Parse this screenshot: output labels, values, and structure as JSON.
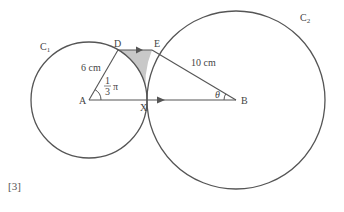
{
  "diagram": {
    "labels": {
      "c1": "C",
      "c1_sub": "1",
      "c2": "C",
      "c2_sub": "2",
      "d": "D",
      "e": "E",
      "a": "A",
      "x": "X",
      "b": "B",
      "ad_length": "6 cm",
      "eb_length": "10 cm",
      "angle_a_num": "1",
      "angle_a_den": "3",
      "angle_a_pi": "π",
      "angle_b": "θ"
    },
    "colors": {
      "line": "#555555",
      "shade": "#c8c8c8"
    }
  },
  "marks": "[3]"
}
